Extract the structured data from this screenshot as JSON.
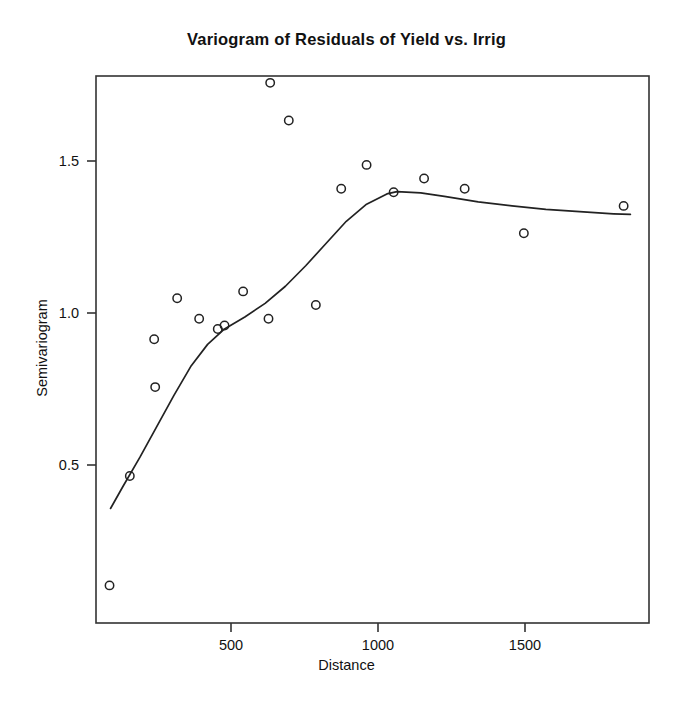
{
  "chart_data": {
    "type": "scatter",
    "title": "Variogram of Residuals of Yield vs. Irrig",
    "xlabel": "Distance",
    "ylabel": "Semivariogram",
    "xlim": [
      120,
      1755
    ],
    "ylim": [
      0.2,
      1.8
    ],
    "grid": false,
    "legend": "none",
    "xticks": [
      500,
      1000,
      1500
    ],
    "xtick_labels": [
      "500",
      "1000",
      "1500"
    ],
    "yticks": [
      0.5,
      1.0,
      1.5
    ],
    "ytick_labels": [
      "0.5",
      "1.0",
      "1.5"
    ],
    "series": [
      {
        "name": "Empirical semivariogram",
        "marker": "open-circle",
        "color": "#222222",
        "x": [
          160,
          220,
          292,
          295,
          360,
          425,
          480,
          500,
          555,
          630,
          635,
          690,
          770,
          845,
          920,
          1000,
          1090,
          1210,
          1385,
          1680
        ],
        "y": [
          0.31,
          0.63,
          1.03,
          0.89,
          1.15,
          1.09,
          1.06,
          1.07,
          1.17,
          1.09,
          1.78,
          1.67,
          1.13,
          1.47,
          1.54,
          1.46,
          1.5,
          1.47,
          1.34,
          1.42
        ]
      },
      {
        "name": "Fitted smooth curve",
        "marker": "none",
        "style": "line",
        "color": "#222222",
        "x": [
          163,
          200,
          250,
          300,
          350,
          400,
          450,
          500,
          560,
          620,
          680,
          740,
          800,
          860,
          920,
          980,
          1010,
          1080,
          1150,
          1250,
          1350,
          1450,
          1550,
          1650,
          1700
        ],
        "y": [
          0.535,
          0.6,
          0.685,
          0.775,
          0.865,
          0.95,
          1.015,
          1.06,
          1.095,
          1.135,
          1.185,
          1.245,
          1.31,
          1.375,
          1.425,
          1.455,
          1.462,
          1.458,
          1.448,
          1.432,
          1.42,
          1.41,
          1.403,
          1.397,
          1.395
        ]
      }
    ]
  }
}
